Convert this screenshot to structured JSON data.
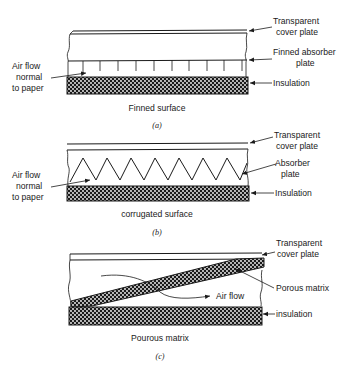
{
  "figure": {
    "panels": [
      {
        "id": "a",
        "caption": "Finned surface",
        "sublabel": "(a)",
        "labels": {
          "cover_line1": "Transparent",
          "cover_line2": "cover plate",
          "absorber_line1": "Finned absorber",
          "absorber_line2": "plate",
          "insulation": "Insulation",
          "airflow_line1": "Air flow",
          "airflow_line2": "normal",
          "airflow_line3": "to paper"
        },
        "fin_count": 11
      },
      {
        "id": "b",
        "caption": "corrugated surface",
        "sublabel": "(b)",
        "labels": {
          "cover_line1": "Transparent",
          "cover_line2": "cover plate",
          "absorber_line1": "Absorber",
          "absorber_line2": "plate",
          "insulation": "Insulation",
          "airflow_line1": "Air flow",
          "airflow_line2": "normal",
          "airflow_line3": "to paper"
        },
        "corrugation_peaks": 8
      },
      {
        "id": "c",
        "caption": "Pourous matrix",
        "sublabel": "(c)",
        "labels": {
          "cover_line1": "Transparent",
          "cover_line2": "cover plate",
          "matrix": "Porous matrix",
          "airflow": "Air flow",
          "insulation": "insulation"
        }
      }
    ],
    "colors": {
      "ink": "#1a1a1a",
      "background": "#ffffff"
    }
  }
}
